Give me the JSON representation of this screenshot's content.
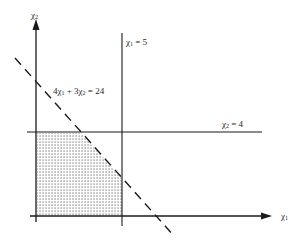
{
  "diagram": {
    "type": "linear-programming-feasible-region",
    "axes": {
      "x_label_symbol": "χ",
      "x_label_sub": "1",
      "y_label_symbol": "χ",
      "y_label_sub": "2"
    },
    "constraints": [
      {
        "id": "vertical",
        "label_symbol": "χ",
        "label_sub": "1",
        "label_rest": " = 5",
        "style": "solid"
      },
      {
        "id": "horizontal",
        "label_symbol": "χ",
        "label_sub": "2",
        "label_rest": " = 4",
        "style": "solid"
      },
      {
        "id": "diagonal",
        "label_prefix": "4χ",
        "label_sub1": "1",
        "label_mid": " + 3χ",
        "label_sub2": "2",
        "label_rest": " = 24",
        "style": "dashed"
      }
    ],
    "feasible_region": {
      "fill": "dotted",
      "description": "Shaded region bounded by axes, χ2 = 4, 4χ1 + 3χ2 = 24, and χ1 = 5"
    },
    "colors": {
      "line": "#1a1a1a",
      "text": "#2a2a2a",
      "dot": "#555555",
      "background": "#ffffff"
    }
  }
}
